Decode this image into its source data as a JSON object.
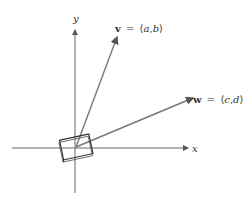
{
  "diagram": {
    "axes": {
      "x_label": "x",
      "y_label": "y"
    },
    "vectors": [
      {
        "name": "v",
        "eq": "=",
        "open": "⟨",
        "a": "a",
        "comma": ",",
        "b": "b",
        "close": "⟩"
      },
      {
        "name": "w",
        "eq": "=",
        "open": "⟨",
        "a": "c",
        "comma": ",",
        "b": "d",
        "close": "⟩"
      }
    ],
    "colors": {
      "axis": "#555555",
      "vector": "#6a6a6a",
      "parallelogram": "#333333"
    }
  }
}
